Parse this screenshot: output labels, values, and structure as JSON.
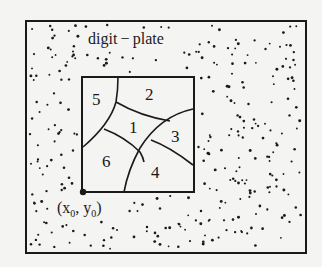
{
  "diagram": {
    "title_label": "digit − plate",
    "origin_label": "(x",
    "origin_sub_x": "0",
    "origin_mid": ", y",
    "origin_sub_y": "0",
    "origin_end": ")",
    "regions": [
      {
        "id": "1",
        "label": "1"
      },
      {
        "id": "2",
        "label": "2"
      },
      {
        "id": "3",
        "label": "3"
      },
      {
        "id": "4",
        "label": "4"
      },
      {
        "id": "5",
        "label": "5"
      },
      {
        "id": "6",
        "label": "6"
      }
    ],
    "colors": {
      "ink": "#1a1a1a",
      "paper": "#f4f4f2"
    }
  }
}
